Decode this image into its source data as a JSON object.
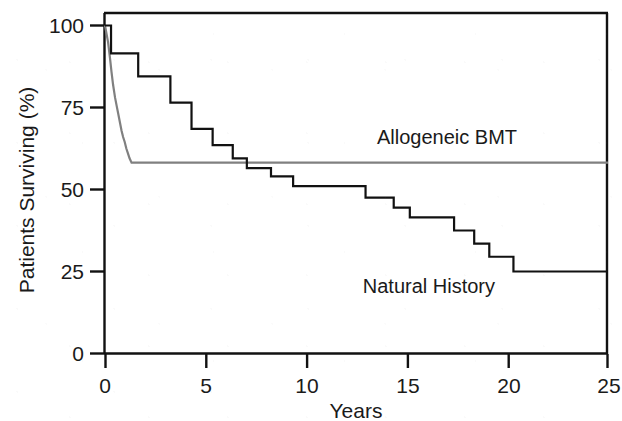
{
  "chart_data": {
    "type": "line",
    "subtype": "kaplan-meier-step",
    "title": "",
    "xlabel": "Years",
    "ylabel": "Patients Surviving (%)",
    "xlim": [
      0,
      25
    ],
    "ylim": [
      0,
      100
    ],
    "xticks": [
      0,
      5,
      10,
      15,
      20,
      25
    ],
    "xtick_labels": [
      "0",
      "5",
      "10",
      "15",
      "20",
      "25"
    ],
    "yticks": [
      0,
      25,
      50,
      75,
      100
    ],
    "ytick_labels": [
      "0",
      "25",
      "50",
      "75",
      "100"
    ],
    "grid": false,
    "legend_position": "inline-annotation",
    "series": [
      {
        "name": "Allogeneic BMT",
        "color": "#808080",
        "line_width": 2.2,
        "label_x": 17.0,
        "label_y": 64.0,
        "points": [
          [
            0.0,
            100.0
          ],
          [
            0.15,
            95.0
          ],
          [
            0.25,
            90.0
          ],
          [
            0.32,
            86.0
          ],
          [
            0.4,
            82.0
          ],
          [
            0.5,
            78.0
          ],
          [
            0.58,
            75.5
          ],
          [
            0.66,
            73.0
          ],
          [
            0.74,
            70.5
          ],
          [
            0.82,
            68.0
          ],
          [
            0.9,
            66.0
          ],
          [
            0.98,
            64.5
          ],
          [
            1.06,
            62.5
          ],
          [
            1.14,
            61.0
          ],
          [
            1.22,
            59.5
          ],
          [
            1.32,
            58.2
          ],
          [
            25.0,
            58.2
          ]
        ]
      },
      {
        "name": "Natural History",
        "color": "#111111",
        "line_width": 2.2,
        "label_x": 16.1,
        "label_y": 18.5,
        "points": [
          [
            0.0,
            100.0
          ],
          [
            0.3,
            100.0
          ],
          [
            0.3,
            91.5
          ],
          [
            1.65,
            91.5
          ],
          [
            1.65,
            84.5
          ],
          [
            3.25,
            84.5
          ],
          [
            3.25,
            76.5
          ],
          [
            4.3,
            76.5
          ],
          [
            4.3,
            68.5
          ],
          [
            5.35,
            68.5
          ],
          [
            5.35,
            63.5
          ],
          [
            6.35,
            63.5
          ],
          [
            6.35,
            59.5
          ],
          [
            7.05,
            59.5
          ],
          [
            7.05,
            56.5
          ],
          [
            8.25,
            56.5
          ],
          [
            8.25,
            54.0
          ],
          [
            9.35,
            54.0
          ],
          [
            9.35,
            51.0
          ],
          [
            12.95,
            51.0
          ],
          [
            12.95,
            47.5
          ],
          [
            14.35,
            47.5
          ],
          [
            14.35,
            44.5
          ],
          [
            15.15,
            44.5
          ],
          [
            15.15,
            41.5
          ],
          [
            17.35,
            41.5
          ],
          [
            17.35,
            37.5
          ],
          [
            18.35,
            37.5
          ],
          [
            18.35,
            33.5
          ],
          [
            19.1,
            33.5
          ],
          [
            19.1,
            29.5
          ],
          [
            20.3,
            29.5
          ],
          [
            20.3,
            25.0
          ],
          [
            25.0,
            25.0
          ]
        ]
      }
    ]
  },
  "axes": {
    "y_title": "Patients Surviving (%)",
    "x_title": "Years"
  },
  "annotations": {
    "allogeneic_label": "Allogeneic BMT",
    "natural_label": "Natural History"
  },
  "colors": {
    "axis": "#111111",
    "allogeneic": "#808080",
    "natural": "#111111",
    "background": "#ffffff"
  }
}
